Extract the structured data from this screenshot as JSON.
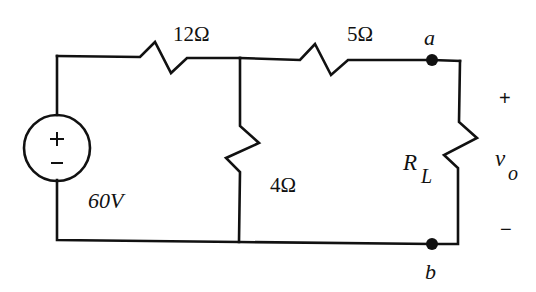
{
  "diagram": {
    "type": "electrical-circuit",
    "colors": {
      "ink": "#111111",
      "background": "#ffffff"
    },
    "source": {
      "kind": "independent-voltage-source",
      "value_label": "60V",
      "plus_sign": "+",
      "minus_sign": "−"
    },
    "resistors": [
      {
        "id": "r1",
        "label": "12Ω",
        "orientation": "horizontal",
        "branch": "series-top-left"
      },
      {
        "id": "r2",
        "label": "5Ω",
        "orientation": "horizontal",
        "branch": "series-top-right"
      },
      {
        "id": "r3",
        "label": "4Ω",
        "orientation": "vertical",
        "branch": "shunt-middle"
      },
      {
        "id": "rl",
        "label_main": "R",
        "label_sub": "L",
        "orientation": "vertical",
        "branch": "load"
      }
    ],
    "terminals": {
      "a": {
        "label": "a"
      },
      "b": {
        "label": "b"
      }
    },
    "output_voltage": {
      "label_main": "v",
      "label_sub": "o",
      "plus_sign": "+",
      "minus_sign": "−"
    }
  }
}
